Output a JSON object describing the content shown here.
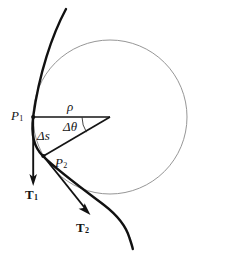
{
  "figure": {
    "background_color": "#ffffff",
    "curve_color": "#111111",
    "circle_color": "#808080",
    "line_color": "#151515",
    "text_color": "#151515",
    "labels": {
      "point_1": "P",
      "point_1_sub": "1",
      "point_2": "P",
      "point_2_sub": "2",
      "radius": "ρ",
      "arc_length": "Δs",
      "angle": "Δθ",
      "tangent_1": "T",
      "tangent_1_sub": "1",
      "tangent_2": "T",
      "tangent_2_sub": "2"
    },
    "geometry": {
      "circle_center_x": 110,
      "circle_center_y": 117,
      "circle_radius": 77,
      "p1_x": 33,
      "p1_y": 117,
      "p2_x": 43,
      "p2_y": 156,
      "t1_tip_x": 33,
      "t1_tip_y": 185,
      "t2_tip_x": 90,
      "t2_tip_y": 214
    }
  }
}
